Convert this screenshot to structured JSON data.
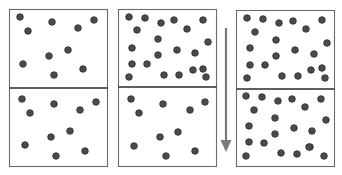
{
  "colors": {
    "background": "#ffffff",
    "box_stroke": "#6b6b6b",
    "divider": "#2a2a2a",
    "dot_fill": "#4a4a4a",
    "dot_stroke": "#2e2e2e",
    "arrow": "#7a7a7a"
  },
  "dot_radius": 3.3,
  "panels": [
    {
      "name": "panel-1",
      "box": {
        "x": 9,
        "y": 9,
        "w": 98,
        "h": 157
      },
      "divider_y": 88,
      "top_dots": [
        [
          20,
          17
        ],
        [
          28,
          31
        ],
        [
          52,
          22
        ],
        [
          78,
          28
        ],
        [
          94,
          20
        ],
        [
          49,
          56
        ],
        [
          68,
          50
        ],
        [
          23,
          64
        ],
        [
          54,
          75
        ],
        [
          83,
          69
        ]
      ],
      "bottom_dots": [
        [
          22,
          99
        ],
        [
          30,
          113
        ],
        [
          54,
          104
        ],
        [
          80,
          110
        ],
        [
          96,
          102
        ],
        [
          51,
          137
        ],
        [
          70,
          131
        ],
        [
          25,
          145
        ],
        [
          56,
          156
        ],
        [
          85,
          151
        ]
      ]
    },
    {
      "name": "panel-2",
      "box": {
        "x": 118,
        "y": 9,
        "w": 98,
        "h": 157
      },
      "divider_y": 87,
      "top_dots": [
        [
          129,
          17
        ],
        [
          145,
          18
        ],
        [
          161,
          23
        ],
        [
          174,
          20
        ],
        [
          203,
          20
        ],
        [
          137,
          30
        ],
        [
          187,
          29
        ],
        [
          158,
          39
        ],
        [
          208,
          42
        ],
        [
          132,
          48
        ],
        [
          158,
          55
        ],
        [
          177,
          50
        ],
        [
          195,
          53
        ],
        [
          132,
          64
        ],
        [
          147,
          64
        ],
        [
          203,
          69
        ],
        [
          129,
          77
        ],
        [
          164,
          75
        ],
        [
          179,
          75
        ],
        [
          193,
          70
        ],
        [
          206,
          77
        ]
      ],
      "bottom_dots": [
        [
          131,
          99
        ],
        [
          163,
          104
        ],
        [
          139,
          113
        ],
        [
          190,
          110
        ],
        [
          205,
          102
        ],
        [
          160,
          137
        ],
        [
          178,
          132
        ],
        [
          134,
          146
        ],
        [
          166,
          156
        ],
        [
          195,
          151
        ]
      ]
    },
    {
      "name": "panel-3",
      "box": {
        "x": 236,
        "y": 10,
        "w": 98,
        "h": 156
      },
      "divider_y": 89,
      "top_dots": [
        [
          247,
          18
        ],
        [
          263,
          19
        ],
        [
          279,
          23
        ],
        [
          293,
          21
        ],
        [
          322,
          20
        ],
        [
          255,
          32
        ],
        [
          306,
          29
        ],
        [
          276,
          40
        ],
        [
          327,
          43
        ],
        [
          250,
          48
        ],
        [
          276,
          56
        ],
        [
          295,
          50
        ],
        [
          314,
          54
        ],
        [
          250,
          65
        ],
        [
          265,
          65
        ],
        [
          322,
          68
        ],
        [
          247,
          78
        ],
        [
          282,
          76
        ],
        [
          298,
          76
        ],
        [
          311,
          70
        ],
        [
          325,
          78
        ]
      ],
      "bottom_dots": [
        [
          246,
          96
        ],
        [
          262,
          97
        ],
        [
          278,
          101
        ],
        [
          292,
          99
        ],
        [
          321,
          99
        ],
        [
          254,
          110
        ],
        [
          305,
          107
        ],
        [
          275,
          118
        ],
        [
          326,
          120
        ],
        [
          249,
          126
        ],
        [
          294,
          128
        ],
        [
          312,
          131
        ],
        [
          275,
          134
        ],
        [
          249,
          142
        ],
        [
          264,
          143
        ],
        [
          310,
          147
        ],
        [
          246,
          156
        ],
        [
          281,
          153
        ],
        [
          297,
          154
        ],
        [
          309,
          147
        ],
        [
          324,
          156
        ]
      ]
    }
  ],
  "arrow": {
    "x": 226,
    "y_start": 28,
    "y_shaft_end": 141,
    "y_tip": 152,
    "head_half_width": 5.5,
    "shaft_width": 2.2,
    "direction": "down"
  }
}
